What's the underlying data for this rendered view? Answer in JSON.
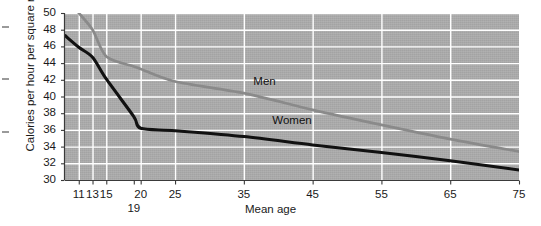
{
  "chart_data": {
    "type": "line",
    "title": "",
    "xlabel": "Mean age",
    "ylabel": "Calories per hour per square meter",
    "xlim": [
      9,
      75
    ],
    "ylim": [
      30,
      50
    ],
    "grid": true,
    "legend": "inline-labels",
    "y_ticks": [
      50,
      48,
      46,
      44,
      42,
      40,
      38,
      36,
      34,
      32,
      30
    ],
    "x_ticks": [
      11,
      13,
      15,
      19,
      20,
      25,
      35,
      45,
      55,
      65,
      75
    ],
    "x_tick_labels": [
      "11",
      "13",
      "15",
      "19",
      "20",
      "25",
      "35",
      "45",
      "55",
      "65",
      "75"
    ],
    "series": [
      {
        "name": "Men",
        "color": "#8a8a8a",
        "label_x": 38,
        "label_y": 41.9,
        "x": [
          11,
          13,
          15,
          19,
          20,
          25,
          35,
          45,
          55,
          65,
          75
        ],
        "values": [
          50.0,
          48.0,
          44.8,
          43.6,
          43.3,
          41.8,
          40.4,
          38.4,
          36.6,
          34.9,
          33.4
        ]
      },
      {
        "name": "Women",
        "color": "#111111",
        "label_x": 42,
        "label_y": 37.2,
        "x": [
          9,
          11,
          13,
          15,
          19,
          20,
          25,
          35,
          45,
          55,
          65,
          75
        ],
        "values": [
          47.3,
          45.9,
          44.7,
          42.1,
          37.6,
          36.2,
          35.9,
          35.2,
          34.2,
          33.3,
          32.3,
          31.2
        ]
      }
    ]
  }
}
